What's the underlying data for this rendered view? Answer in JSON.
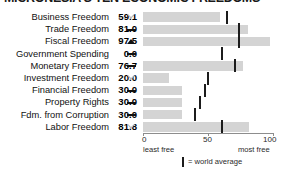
{
  "chart_data": {
    "type": "bar",
    "title": "MICRONESIA'S TEN ECONOMIC FREEDOMS",
    "orientation": "horizontal",
    "xlabel": "",
    "ylabel": "",
    "xlim": [
      0,
      100
    ],
    "grid": false,
    "axis_ticks": [
      {
        "value": 0,
        "label": "0"
      },
      {
        "value": 50,
        "label": "50"
      },
      {
        "value": 100,
        "label": "100"
      }
    ],
    "axis_captions": {
      "left": "least free",
      "right": "most free"
    },
    "legend": {
      "marker": "|",
      "text": "= world average",
      "position": "bottom-center"
    },
    "colors": {
      "bar": "#d4d4d4",
      "world_average_tick": "#1c1c1c",
      "text": "#111111",
      "axis": "#8d8d8d",
      "trend_up": "#111111",
      "trend_down_outline": "#b9b9b9"
    },
    "categories": [
      "Business Freedom",
      "Trade Freedom",
      "Fiscal Freedom",
      "Government Spending",
      "Monetary Freedom",
      "Investment Freedom",
      "Financial Freedom",
      "Property Rights",
      "Fdm. from Corruption",
      "Labor Freedom"
    ],
    "values": [
      59.1,
      81.0,
      97.5,
      0.0,
      76.7,
      20.0,
      30.0,
      30.0,
      30.0,
      81.8
    ],
    "value_labels": [
      "59.1",
      "81.0",
      "97.5",
      "0.0",
      "76.7",
      "20.0",
      "30.0",
      "30.0",
      "30.0",
      "81.8"
    ],
    "trend_markers": [
      "down",
      "flat",
      "up",
      "flat",
      "flat",
      "down",
      "flat",
      "flat",
      "flat",
      "down"
    ],
    "world_average": [
      64.6,
      74.0,
      74.0,
      61.0,
      71.0,
      50.0,
      48.0,
      44.0,
      40.0,
      61.0
    ],
    "rows": [
      {
        "label": "Business Freedom",
        "value": 59.1,
        "value_label": "59.1",
        "trend": "down",
        "world_average": 64.6
      },
      {
        "label": "Trade Freedom",
        "value": 81.0,
        "value_label": "81.0",
        "trend": "flat",
        "world_average": 74.0
      },
      {
        "label": "Fiscal Freedom",
        "value": 97.5,
        "value_label": "97.5",
        "trend": "up",
        "world_average": 74.0
      },
      {
        "label": "Government Spending",
        "value": 0.0,
        "value_label": "0.0",
        "trend": "flat",
        "world_average": 61.0
      },
      {
        "label": "Monetary Freedom",
        "value": 76.7,
        "value_label": "76.7",
        "trend": "flat",
        "world_average": 71.0
      },
      {
        "label": "Investment Freedom",
        "value": 20.0,
        "value_label": "20.0",
        "trend": "down",
        "world_average": 50.0
      },
      {
        "label": "Financial Freedom",
        "value": 30.0,
        "value_label": "30.0",
        "trend": "flat",
        "world_average": 48.0
      },
      {
        "label": "Property Rights",
        "value": 30.0,
        "value_label": "30.0",
        "trend": "flat",
        "world_average": 44.0
      },
      {
        "label": "Fdm. from Corruption",
        "value": 30.0,
        "value_label": "30.0",
        "trend": "flat",
        "world_average": 40.0
      },
      {
        "label": "Labor Freedom",
        "value": 81.8,
        "value_label": "81.8",
        "trend": "down",
        "world_average": 61.0
      }
    ]
  }
}
